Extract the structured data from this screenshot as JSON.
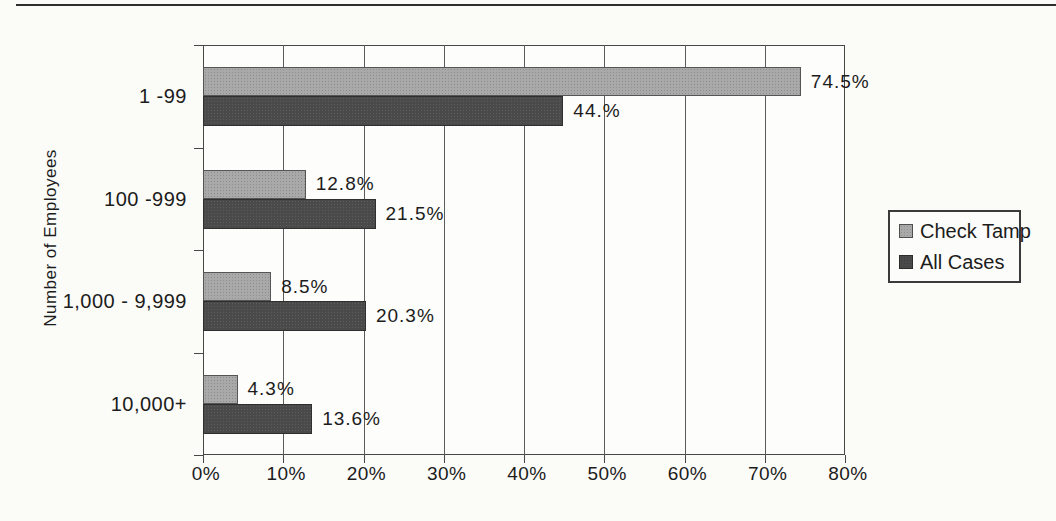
{
  "page": {
    "rule_color": "#2e2e2e",
    "background": "#fbfbf8"
  },
  "chart_data": {
    "type": "bar",
    "orientation": "horizontal",
    "title": "",
    "xlabel": "",
    "ylabel": "Number of Employees",
    "grid": true,
    "xlim": [
      0,
      80
    ],
    "x_ticks": [
      0,
      10,
      20,
      30,
      40,
      50,
      60,
      70,
      80
    ],
    "x_tick_labels": [
      "0%",
      "10%",
      "20%",
      "30%",
      "40%",
      "50%",
      "60%",
      "70%",
      "80%"
    ],
    "categories": [
      "1 -99",
      "100 -999",
      "1,000 - 9,999",
      "10,000+"
    ],
    "series": [
      {
        "name": "Check Tamp",
        "color": "#a9a9a9",
        "values": [
          74.5,
          12.8,
          8.5,
          4.3
        ],
        "value_labels": [
          "74.5%",
          "12.8%",
          "8.5%",
          "4.3%"
        ]
      },
      {
        "name": "All Cases",
        "color": "#4a4a4a",
        "values": [
          44.9,
          21.5,
          20.3,
          13.6
        ],
        "value_labels": [
          "44.%",
          "21.5%",
          "20.3%",
          "13.6%"
        ]
      }
    ],
    "legend": {
      "position": "right",
      "items": [
        "Check Tamp",
        "All Cases"
      ]
    }
  }
}
